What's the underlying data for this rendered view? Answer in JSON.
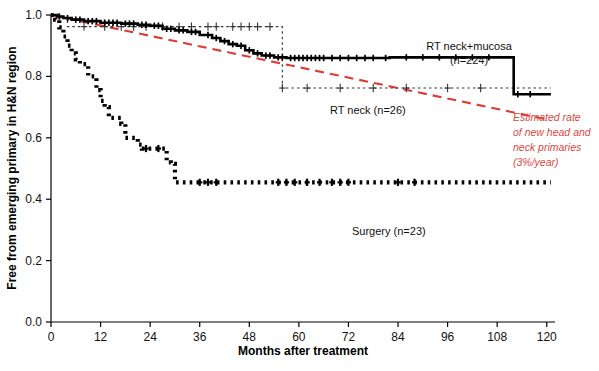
{
  "chart_data": {
    "type": "line",
    "title": "",
    "xlabel": "Months after treatment",
    "ylabel": "Free from emerging primary in H&N region",
    "xlim": [
      0,
      122
    ],
    "ylim": [
      0.0,
      1.0
    ],
    "xticks": [
      0,
      12,
      24,
      36,
      48,
      60,
      72,
      84,
      96,
      108,
      120
    ],
    "xtick_labels": [
      "0",
      "12",
      "24",
      "36",
      "48",
      "60",
      "72",
      "84",
      "96",
      "108",
      "120"
    ],
    "yticks": [
      0.0,
      0.2,
      0.4,
      0.6,
      0.8,
      1.0
    ],
    "ytick_labels": [
      "0.0",
      "0.2",
      "0.4",
      "0.6",
      "0.8",
      "1.0"
    ],
    "grid": false,
    "legend_position": "inline-annotations",
    "series": [
      {
        "name": "RT neck+mucosa",
        "n": 224,
        "style": "solid-step",
        "color": "#000000",
        "label": "RT neck+mucosa",
        "sublabel": "(n=224)",
        "steps": [
          [
            0,
            1.0
          ],
          [
            1.5,
            0.995
          ],
          [
            3,
            0.99
          ],
          [
            5,
            0.985
          ],
          [
            8,
            0.98
          ],
          [
            12,
            0.975
          ],
          [
            17,
            0.972
          ],
          [
            21,
            0.968
          ],
          [
            24,
            0.965
          ],
          [
            27,
            0.955
          ],
          [
            30,
            0.95
          ],
          [
            33,
            0.945
          ],
          [
            36,
            0.935
          ],
          [
            39,
            0.925
          ],
          [
            41,
            0.915
          ],
          [
            43,
            0.905
          ],
          [
            45,
            0.9
          ],
          [
            47,
            0.885
          ],
          [
            49,
            0.875
          ],
          [
            51,
            0.868
          ],
          [
            54,
            0.862
          ],
          [
            57,
            0.86
          ],
          [
            80,
            0.86
          ],
          [
            82,
            0.862
          ],
          [
            83,
            0.862
          ],
          [
            110,
            0.862
          ],
          [
            112,
            0.742
          ],
          [
            121,
            0.742
          ]
        ],
        "censor_marks": [
          2,
          4,
          6,
          7,
          9,
          10,
          11,
          13,
          14,
          15,
          16,
          18,
          19,
          20,
          22,
          23,
          25,
          26,
          28,
          29,
          31,
          32,
          34,
          35,
          38,
          40,
          42,
          44,
          46,
          48,
          50,
          52,
          53,
          55,
          56,
          58,
          59,
          60,
          61,
          62,
          63,
          64,
          65,
          66,
          68,
          70,
          72,
          74,
          76,
          78,
          81,
          86,
          90,
          94,
          98,
          102,
          106,
          113,
          116
        ]
      },
      {
        "name": "RT neck",
        "n": 26,
        "style": "dotted-step",
        "color": "#333333",
        "label": "RT neck (n=26)",
        "steps": [
          [
            0,
            1.0
          ],
          [
            2,
            0.99
          ],
          [
            4,
            0.962
          ],
          [
            56,
            0.962
          ],
          [
            56,
            0.762
          ],
          [
            121,
            0.762
          ]
        ],
        "censor_marks": [
          8,
          13,
          17,
          20,
          23,
          27,
          31,
          34,
          38,
          40,
          44,
          46,
          48,
          50,
          53,
          56,
          62,
          70,
          78,
          86,
          96,
          104
        ]
      },
      {
        "name": "Surgery",
        "n": 23,
        "style": "dotted-step",
        "color": "#000000",
        "label": "Surgery (n=23)",
        "steps": [
          [
            0,
            1.0
          ],
          [
            1,
            0.985
          ],
          [
            2,
            0.96
          ],
          [
            3,
            0.93
          ],
          [
            4,
            0.9
          ],
          [
            5,
            0.875
          ],
          [
            6,
            0.855
          ],
          [
            7,
            0.84
          ],
          [
            8,
            0.84
          ],
          [
            9,
            0.8
          ],
          [
            10,
            0.8
          ],
          [
            11,
            0.755
          ],
          [
            12,
            0.72
          ],
          [
            13,
            0.7
          ],
          [
            14,
            0.665
          ],
          [
            15,
            0.665
          ],
          [
            17,
            0.645
          ],
          [
            18,
            0.6
          ],
          [
            19,
            0.6
          ],
          [
            21,
            0.578
          ],
          [
            22,
            0.565
          ],
          [
            24,
            0.565
          ],
          [
            26,
            0.565
          ],
          [
            27,
            0.565
          ],
          [
            28,
            0.52
          ],
          [
            29,
            0.515
          ],
          [
            30,
            0.455
          ],
          [
            121,
            0.455
          ]
        ],
        "censor_marks": [
          23,
          26,
          36,
          38,
          40,
          55,
          57,
          59,
          62,
          65,
          68,
          70,
          72,
          84,
          88
        ]
      },
      {
        "name": "Estimated rate of new head and neck primaries",
        "style": "dashed-line",
        "color": "#e03a34",
        "rate_per_year": "3%/year",
        "annotation": [
          "Estimated rate",
          "of new head and",
          "neck primaries",
          "(3%/year)"
        ],
        "points": [
          [
            0,
            1.0
          ],
          [
            120,
            0.66
          ]
        ]
      }
    ]
  },
  "annotations": {
    "rt_neck_mucosa_line1": "RT neck+mucosa",
    "rt_neck_mucosa_line2": "(n=224)",
    "rt_neck": "RT neck (n=26)",
    "surgery": "Surgery (n=23)",
    "red_line1": "Estimated rate",
    "red_line2": "of new head and",
    "red_line3": "neck primaries",
    "red_line4": "(3%/year)"
  },
  "axes": {
    "x_title": "Months after treatment",
    "y_title": "Free from emerging primary in H&N region"
  },
  "colors": {
    "red_accent": "#e03a34",
    "curve_black": "#000000",
    "axis": "#000000"
  }
}
